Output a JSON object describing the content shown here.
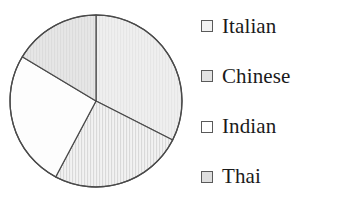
{
  "chart_data": {
    "type": "pie",
    "title": "",
    "categories": [
      "Italian",
      "Chinese",
      "Indian",
      "Thai"
    ],
    "values": [
      32.5,
      16.4,
      25.8,
      25.3
    ],
    "units": "percent",
    "start_angle_deg": 0,
    "direction": "clockwise",
    "slice_angles_deg": [
      117,
      59,
      93,
      91
    ],
    "legend": {
      "position": "right",
      "entries": [
        {
          "label": "Italian",
          "swatch_name": "legend-swatch-italian",
          "fill": "#ebebeb",
          "stroke": "#5a5a5a"
        },
        {
          "label": "Chinese",
          "swatch_name": "legend-swatch-chinese",
          "fill": "#e0e0e0",
          "stroke": "#5a5a5a"
        },
        {
          "label": "Indian",
          "swatch_name": "legend-swatch-indian",
          "fill": "#fdfdfd",
          "stroke": "#5a5a5a"
        },
        {
          "label": "Thai",
          "swatch_name": "legend-swatch-thai",
          "fill": "#dcdcdc",
          "stroke": "#5a5a5a"
        }
      ]
    },
    "grid": false,
    "xlabel": "",
    "ylabel": "",
    "slices": [
      {
        "name": "Italian",
        "fill": "#ececec",
        "stroke": "#4a4a4a",
        "start_deg": 0,
        "end_deg": 117
      },
      {
        "name": "Thai",
        "fill": "#e4e4e4",
        "stroke": "#4a4a4a",
        "start_deg": 117,
        "end_deg": 208
      },
      {
        "name": "Indian",
        "fill": "#fdfdfd",
        "stroke": "#4a4a4a",
        "start_deg": 208,
        "end_deg": 301
      },
      {
        "name": "Chinese",
        "fill": "#e2e2e2",
        "stroke": "#4a4a4a",
        "start_deg": 301,
        "end_deg": 360
      }
    ],
    "geometry": {
      "cx": 96,
      "cy": 101,
      "r": 86
    },
    "colors": {
      "outline": "#4a4a4a",
      "text": "#1a1a1a",
      "background": "#ffffff"
    }
  }
}
